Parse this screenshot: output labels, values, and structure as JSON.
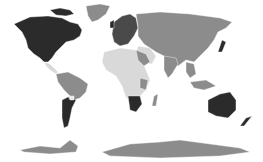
{
  "map": {
    "type": "choropleth-world",
    "colors": {
      "darkest": "#2b2b2b",
      "dark": "#4a4a4a",
      "medium": "#8c8c8c",
      "light": "#d9d9d9",
      "background": "#ffffff"
    },
    "regions": [
      {
        "name": "north-america",
        "shade": "darkest"
      },
      {
        "name": "greenland",
        "shade": "medium"
      },
      {
        "name": "central-america",
        "shade": "light"
      },
      {
        "name": "south-america-north",
        "shade": "medium"
      },
      {
        "name": "argentina",
        "shade": "darkest"
      },
      {
        "name": "europe",
        "shade": "dark"
      },
      {
        "name": "russia-asia",
        "shade": "medium"
      },
      {
        "name": "middle-east",
        "shade": "light"
      },
      {
        "name": "africa",
        "shade": "light"
      },
      {
        "name": "south-africa",
        "shade": "darkest"
      },
      {
        "name": "india",
        "shade": "medium"
      },
      {
        "name": "southeast-asia",
        "shade": "medium"
      },
      {
        "name": "australia",
        "shade": "darkest"
      },
      {
        "name": "new-zealand",
        "shade": "darkest"
      },
      {
        "name": "antarctica",
        "shade": "medium"
      }
    ]
  }
}
